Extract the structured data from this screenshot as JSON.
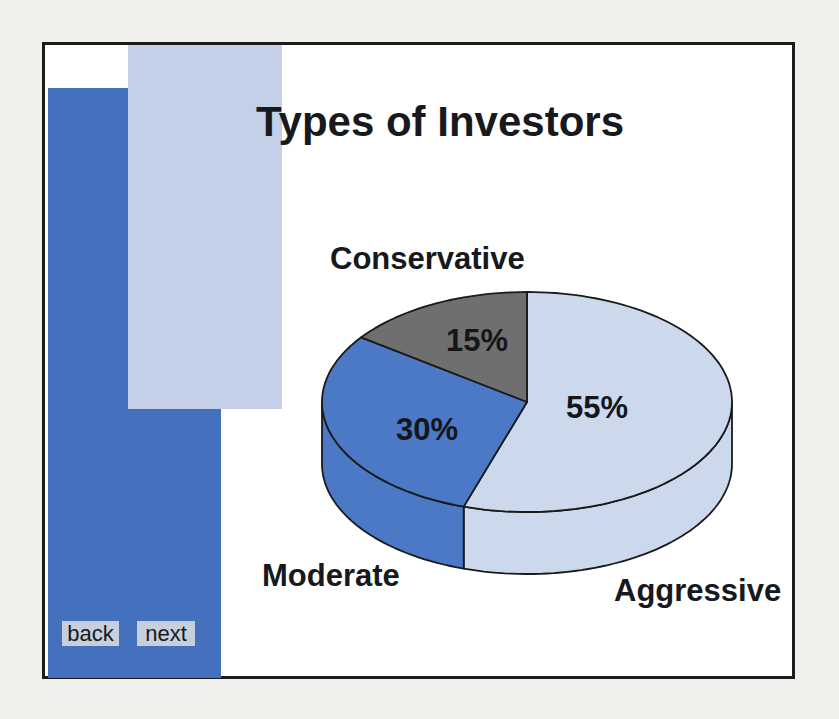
{
  "slide": {
    "title": "Types of Investors"
  },
  "nav": {
    "back_label": "back",
    "next_label": "next"
  },
  "chart_data": {
    "type": "pie",
    "style": "3d",
    "title": "Types of Investors",
    "direction": "clockwise",
    "start_angle_deg_from_top": 0,
    "total": 100,
    "slices": [
      {
        "label": "Aggressive",
        "value": 55,
        "value_label": "55%",
        "color": "#ccd9ec"
      },
      {
        "label": "Moderate",
        "value": 30,
        "value_label": "30%",
        "color": "#4b79c6"
      },
      {
        "label": "Conservative",
        "value": 15,
        "value_label": "15%",
        "color": "#6f6f6f"
      }
    ]
  },
  "colors": {
    "page_bg": "#f0f1ec",
    "slide_bg": "#ffffff",
    "frame_border": "#1c1c1c",
    "decor_dark_blue": "#4470bd",
    "decor_light_blue": "#c3d0e7",
    "button_bg": "#c6cfdb",
    "pie_outline": "#1a1a1a"
  }
}
